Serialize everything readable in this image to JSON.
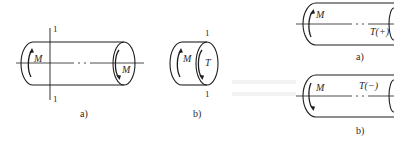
{
  "figure_left": {
    "a": {
      "caption": "a)",
      "section_label_top": "1",
      "section_label_bottom": "1",
      "moment_left": "M",
      "moment_right": "M"
    },
    "b": {
      "caption": "b)",
      "section_label_top": "1",
      "section_label_bottom": "1",
      "moment_label": "M",
      "torque_label": "T"
    }
  },
  "figure_right": {
    "a": {
      "caption": "a)",
      "moment_label": "M",
      "torque_label": "T(+)"
    },
    "b": {
      "caption": "b)",
      "moment_label": "M",
      "torque_label": "T(−)"
    }
  },
  "colors": {
    "line": "#1e1e1e",
    "text": "#2a2a2a",
    "background": "#ffffff"
  }
}
